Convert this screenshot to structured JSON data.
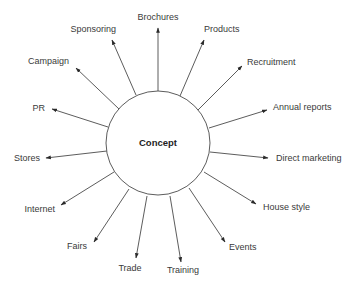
{
  "diagram": {
    "type": "radial-mind-map",
    "center": {
      "label": "Concept",
      "cx": 158,
      "cy": 143,
      "r": 52
    },
    "colors": {
      "line": "#4a4a4a",
      "text": "#3a3a3a",
      "background": "#ffffff"
    },
    "spokes": [
      {
        "label": "Brochures",
        "x1": 158,
        "y1": 91,
        "x2": 158,
        "y2": 28,
        "tx": 158,
        "ty": 20,
        "anchor": "middle"
      },
      {
        "label": "Products",
        "x1": 180,
        "y1": 96,
        "x2": 204,
        "y2": 40,
        "tx": 204,
        "ty": 32,
        "anchor": "start"
      },
      {
        "label": "Recruitment",
        "x1": 198,
        "y1": 110,
        "x2": 242,
        "y2": 66,
        "tx": 247,
        "ty": 65,
        "anchor": "start"
      },
      {
        "label": "Annual reports",
        "x1": 209,
        "y1": 128,
        "x2": 267,
        "y2": 110,
        "tx": 273,
        "ty": 110,
        "anchor": "start"
      },
      {
        "label": "Direct marketing",
        "x1": 210,
        "y1": 152,
        "x2": 268,
        "y2": 158,
        "tx": 276,
        "ty": 161,
        "anchor": "start"
      },
      {
        "label": "House style",
        "x1": 204,
        "y1": 172,
        "x2": 256,
        "y2": 204,
        "tx": 263,
        "ty": 210,
        "anchor": "start"
      },
      {
        "label": "Events",
        "x1": 189,
        "y1": 188,
        "x2": 225,
        "y2": 242,
        "tx": 229,
        "ty": 250,
        "anchor": "start"
      },
      {
        "label": "Training",
        "x1": 170,
        "y1": 196,
        "x2": 181,
        "y2": 262,
        "tx": 183,
        "ty": 273,
        "anchor": "middle"
      },
      {
        "label": "Trade",
        "x1": 147,
        "y1": 196,
        "x2": 136,
        "y2": 258,
        "tx": 130,
        "ty": 271,
        "anchor": "middle"
      },
      {
        "label": "Fairs",
        "x1": 129,
        "y1": 189,
        "x2": 94,
        "y2": 242,
        "tx": 87,
        "ty": 249,
        "anchor": "end"
      },
      {
        "label": "Internet",
        "x1": 114,
        "y1": 172,
        "x2": 61,
        "y2": 205,
        "tx": 55,
        "ty": 212,
        "anchor": "end"
      },
      {
        "label": "Stores",
        "x1": 107,
        "y1": 151,
        "x2": 46,
        "y2": 158,
        "tx": 40,
        "ty": 161,
        "anchor": "end"
      },
      {
        "label": "PR",
        "x1": 108,
        "y1": 127,
        "x2": 52,
        "y2": 109,
        "tx": 45,
        "ty": 111,
        "anchor": "end"
      },
      {
        "label": "Campaign",
        "x1": 119,
        "y1": 109,
        "x2": 76,
        "y2": 68,
        "tx": 69,
        "ty": 64,
        "anchor": "end"
      },
      {
        "label": "Sponsoring",
        "x1": 136,
        "y1": 95,
        "x2": 112,
        "y2": 40,
        "tx": 116,
        "ty": 32,
        "anchor": "end"
      }
    ]
  }
}
